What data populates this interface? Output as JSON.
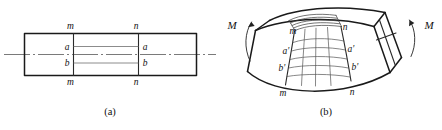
{
  "figure": {
    "panel_a": {
      "caption": "(a)",
      "labels": {
        "m_top": "m",
        "n_top": "n",
        "a_left": "a",
        "a_right": "a",
        "b_left": "b",
        "b_right": "b",
        "m_bottom": "m",
        "n_bottom": "n"
      }
    },
    "panel_b": {
      "caption": "(b)",
      "labels": {
        "moment_left": "M",
        "moment_right": "M",
        "m_top": "m",
        "n_top": "n",
        "a_prime_left": "a'",
        "a_prime_right": "a'",
        "b_prime_left": "b'",
        "b_prime_right": "b'",
        "m_bottom": "m",
        "n_bottom": "n"
      }
    },
    "colors": {
      "background": "#ffffff",
      "outline": "#1a1a1a",
      "grid": "#555555",
      "centerline": "#6b6b6b",
      "text": "#111111"
    }
  }
}
